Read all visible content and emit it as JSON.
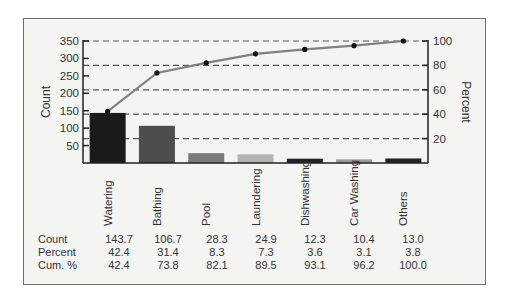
{
  "chart_data": {
    "type": "bar",
    "subtype": "pareto",
    "title": "",
    "categories": [
      "Watering",
      "Bathing",
      "Pool",
      "Laundering",
      "Dishwashing",
      "Car Washing",
      "Others"
    ],
    "series": [
      {
        "name": "Count",
        "type": "bar",
        "axis": "left",
        "values": [
          143.7,
          106.7,
          28.3,
          24.9,
          12.3,
          10.4,
          13.0
        ]
      },
      {
        "name": "Cum. %",
        "type": "line",
        "axis": "right",
        "values": [
          42.4,
          73.8,
          82.1,
          89.5,
          93.1,
          96.2,
          100.0
        ]
      }
    ],
    "percent": [
      42.4,
      31.4,
      8.3,
      7.3,
      3.6,
      3.1,
      3.8
    ],
    "ylabel": "Count",
    "y2label": "Percent",
    "ylim": [
      0,
      350
    ],
    "y2lim": [
      0,
      100
    ],
    "yticks": [
      50,
      100,
      150,
      200,
      250,
      300,
      350
    ],
    "y2ticks": [
      20,
      40,
      60,
      80,
      100
    ],
    "grid": "dashed horizontal at percent ticks",
    "bar_colors": [
      "#1a1a1a",
      "#4d4d4d",
      "#7a7a7a",
      "#b3b3b3",
      "#222222",
      "#9a9a9a",
      "#222222"
    ],
    "line_color": "#808080"
  },
  "table": {
    "row_labels": [
      "Count",
      "Percent",
      "Cum. %"
    ],
    "rows": [
      [
        "143.7",
        "106.7",
        "28.3",
        "24.9",
        "12.3",
        "10.4",
        "13.0"
      ],
      [
        "42.4",
        "31.4",
        "8.3",
        "7.3",
        "3.6",
        "3.1",
        "3.8"
      ],
      [
        "42.4",
        "73.8",
        "82.1",
        "89.5",
        "93.1",
        "96.2",
        "100.0"
      ]
    ]
  }
}
